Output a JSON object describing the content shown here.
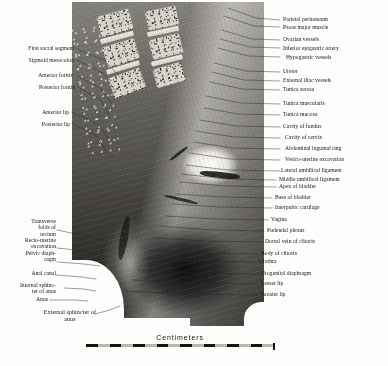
{
  "figure": {
    "plate_type": "anatomical-photograph"
  },
  "scale": {
    "caption": "Centimeters",
    "unit": "cm",
    "segments": 8,
    "segment_colors": [
      "#16150f",
      "#b9b7b0"
    ]
  },
  "labels_left": [
    {
      "id": "first-sacral-segment",
      "text": "First sacral segment"
    },
    {
      "id": "sigmoid-mesocolon",
      "text": "Sigmoid mesocolon"
    },
    {
      "id": "anterior-fornix",
      "text": "Anterior fornix"
    },
    {
      "id": "posterior-fornix",
      "text": "Posterior fornix"
    },
    {
      "id": "anterior-lip",
      "text": "Anterior lip"
    },
    {
      "id": "posterior-lip",
      "text": "Posterior lip"
    },
    {
      "id": "transverse-folds-of-rectum",
      "text": "Transverse\nfolds of\nrectum"
    },
    {
      "id": "recto-uterine-excavation",
      "text": "Recto-uterine\nexcavation"
    },
    {
      "id": "pelvic-diaphragm",
      "text": "Pelvic diaph-\nragm"
    },
    {
      "id": "anal-canal",
      "text": "Anal canal"
    },
    {
      "id": "internal-sphincter-of-anus",
      "text": "Internal sphinc-\nter of anus"
    },
    {
      "id": "anus",
      "text": "Anus"
    },
    {
      "id": "external-sphincter-of-anus",
      "text": "External sphincter of\nanus"
    }
  ],
  "labels_right": [
    {
      "id": "parietal-peritoneum",
      "text": "Parietal peritoneum"
    },
    {
      "id": "psoas-major-muscle",
      "text": "Psoas major muscle"
    },
    {
      "id": "ovarian-vessels",
      "text": "Ovarian vessels"
    },
    {
      "id": "inferior-epigastric-artery",
      "text": "Inferior epigastric artery"
    },
    {
      "id": "hypogastric-vessels",
      "text": "Hypogastric vessels"
    },
    {
      "id": "ureter",
      "text": "Ureter"
    },
    {
      "id": "external-iliac-vessels",
      "text": "External iliac vessels"
    },
    {
      "id": "tunica-serosa",
      "text": "Tunica serosa"
    },
    {
      "id": "tunica-muscularis",
      "text": "Tunica muscularis"
    },
    {
      "id": "tunica-mucosa",
      "text": "Tunica mucosa"
    },
    {
      "id": "cavity-of-fundus",
      "text": "Cavity of fundus"
    },
    {
      "id": "cavity-of-cervix",
      "text": "Cavity of cervix"
    },
    {
      "id": "abdominal-inguinal-ring",
      "text": "Abdominal inguinal ring"
    },
    {
      "id": "vesico-uterine-excavation",
      "text": "Vesico-uterine excavation"
    },
    {
      "id": "lateral-umbilical-ligament",
      "text": "Lateral umbilical ligament"
    },
    {
      "id": "middle-umbilical-ligament",
      "text": "Middle umbilical ligament"
    },
    {
      "id": "apex-of-bladder",
      "text": "Apex of bladder"
    },
    {
      "id": "base-of-bladder",
      "text": "Base of bladder"
    },
    {
      "id": "interpubic-cartilage",
      "text": "Interpubic cartilage"
    },
    {
      "id": "vagina",
      "text": "Vagina"
    },
    {
      "id": "pudendal-plexus",
      "text": "Pudendal plexus"
    },
    {
      "id": "dorsal-vein-of-clitoris",
      "text": "Dorsal vein of clitoris"
    },
    {
      "id": "body-of-clitoris",
      "text": "Body of clitoris"
    },
    {
      "id": "urethra",
      "text": "Urethra"
    },
    {
      "id": "urogenital-diaphragm",
      "text": "Urogenital diaphragm"
    },
    {
      "id": "lesser-lip",
      "text": "Lesser lip"
    },
    {
      "id": "greater-lip",
      "text": "Greater lip"
    }
  ]
}
